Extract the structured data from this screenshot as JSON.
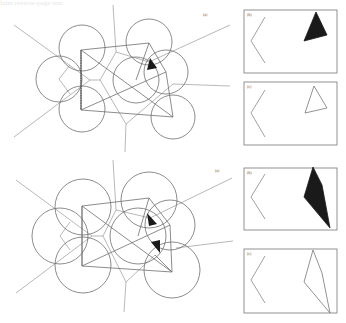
{
  "figure": {
    "background": "#ffffff",
    "stroke_color": "#6e6e6e",
    "light_stroke": "#9a9a9a",
    "fill_dark": "#1a1a1a",
    "show_through_text": "faint reverse-page text"
  },
  "diagrams": [
    {
      "label": "(a)",
      "label_pos": [
        203,
        16
      ],
      "circles": [
        {
          "cx": 82,
          "cy": 48,
          "r": 23
        },
        {
          "cx": 59,
          "cy": 79,
          "r": 23
        },
        {
          "cx": 82,
          "cy": 109,
          "r": 23
        },
        {
          "cx": 149,
          "cy": 42,
          "r": 23
        },
        {
          "cx": 136,
          "cy": 80,
          "r": 23
        },
        {
          "cx": 166,
          "cy": 72,
          "r": 22
        },
        {
          "cx": 173,
          "cy": 117,
          "r": 22
        }
      ],
      "polygon_edges": "M81,50 L149,43 L166,72 L173,117 L81,110 Z M81,50 L173,117 M81,110 L166,72 M81,50 L81,110 M136,80 L149,43",
      "voronoi_edges": "M14,25 L90,80 M14,137 L90,80 M90,80 L100,80 M100,80 L116,52 L113,5 M116,52 L149,62 L230,25 M100,80 L126,124 L125,152 M126,124 L173,84 M173,84 L230,86 M59,79 L70,65 M59,79 L70,94",
      "dashed": "M81,50 L81,110",
      "filled_triangles": [
        {
          "points": "150,58 157,68 147,70"
        }
      ]
    },
    {
      "label": "(a)",
      "label_pos": [
        215,
        172
      ],
      "circles": [
        {
          "cx": 83,
          "cy": 207,
          "r": 28
        },
        {
          "cx": 60,
          "cy": 236,
          "r": 28
        },
        {
          "cx": 83,
          "cy": 265,
          "r": 28
        },
        {
          "cx": 149,
          "cy": 200,
          "r": 28
        },
        {
          "cx": 138,
          "cy": 236,
          "r": 28
        },
        {
          "cx": 170,
          "cy": 225,
          "r": 25
        },
        {
          "cx": 172,
          "cy": 270,
          "r": 28
        }
      ],
      "polygon_edges": "M82,206 L149,198 L170,225 L172,272 L82,266 Z M82,206 L172,272 M82,266 L170,225 M82,206 L82,266 M138,236 L149,198 M155,255 L172,272",
      "voronoi_edges": "M16,180 L92,236 M16,293 L92,236 M92,236 L103,236 M103,236 L116,210 L113,160 M116,210 L150,218 L232,178 M103,236 L126,282 L124,312 M126,282 L155,255 M176,248 L233,241 M60,236 L70,222 M60,236 L70,250",
      "dashed": "",
      "filled_triangles": [
        {
          "points": "147,213 157,224 149,226"
        },
        {
          "points": "151,242 160,240 160,253"
        }
      ]
    }
  ],
  "panels": [
    {
      "label": "(b)",
      "box": [
        244,
        10,
        93,
        63
      ],
      "chevron": "M265,17 L251,41 L265,63",
      "shape": {
        "points": "316,12 327,35 304,41",
        "filled": true
      }
    },
    {
      "label": "(c)",
      "box": [
        244,
        82,
        93,
        63
      ],
      "chevron": "M265,90 L251,113 L265,137",
      "shape": {
        "points": "314,86 327,108 305,113",
        "filled": false
      }
    },
    {
      "label": "(b)",
      "box": [
        244,
        168,
        93,
        62
      ],
      "chevron": "M265,174 L251,197 L265,219",
      "shape": {
        "points": "313,167 322,185 330,228 304,197",
        "filled": true
      }
    },
    {
      "label": "(c)",
      "box": [
        244,
        249,
        93,
        64
      ],
      "chevron": "M265,256 L251,280 L265,303",
      "shape": {
        "points": "313,250 322,273 330,313 304,282",
        "filled": false
      }
    }
  ]
}
